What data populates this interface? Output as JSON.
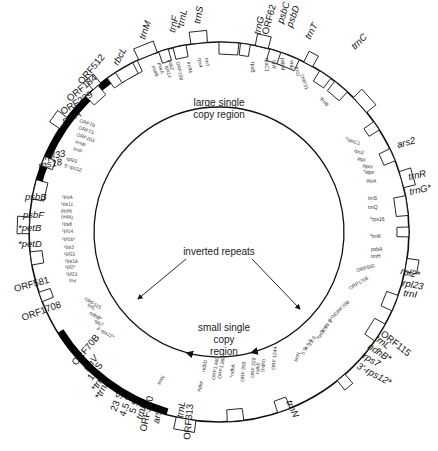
{
  "diagram": {
    "center": [
      219,
      232
    ],
    "outer_radius": 190,
    "inner_arc_radius": 125,
    "colors": {
      "line": "#111111",
      "ir_fill": "#000000",
      "box_fill": "#ffffff"
    },
    "regions": {
      "lsc_line1": "large single",
      "lsc_line2": "copy region",
      "ir": "inverted repeats",
      "ssc_line1": "small single",
      "ssc_line2": "copy",
      "ssc_line3": "region"
    },
    "inverted_repeats": [
      {
        "name": "IR-A",
        "start_deg": 196,
        "end_deg": 238
      },
      {
        "name": "IR-B",
        "start_deg": 283,
        "end_deg": 325
      }
    ],
    "outer_labels": [
      {
        "text": "trnS",
        "x": 200,
        "y": 24,
        "rot": -80,
        "italic": true
      },
      {
        "text": "*trnL",
        "x": 183,
        "y": 30,
        "rot": -78,
        "italic": true
      },
      {
        "text": "trnF",
        "x": 175,
        "y": 33,
        "rot": -78,
        "italic": true
      },
      {
        "text": "trnM",
        "x": 145,
        "y": 40,
        "rot": -72,
        "italic": true
      },
      {
        "text": "rbcL",
        "x": 118,
        "y": 66,
        "rot": -62,
        "italic": true
      },
      {
        "text": "ORF512",
        "x": 82,
        "y": 85,
        "rot": -50,
        "italic": false
      },
      {
        "text": "ORF184",
        "x": 70,
        "y": 102,
        "rot": -40,
        "italic": false
      },
      {
        "text": "ORF229",
        "x": 63,
        "y": 115,
        "rot": -32,
        "italic": false
      },
      {
        "text": "petA",
        "x": 64,
        "y": 124,
        "rot": -25,
        "italic": true
      },
      {
        "text": "rpl33",
        "x": 45,
        "y": 160,
        "rot": -10,
        "italic": true
      },
      {
        "text": "rps18",
        "x": 39,
        "y": 169,
        "rot": -10,
        "italic": true
      },
      {
        "text": "psbB",
        "x": 25,
        "y": 200,
        "rot": 0,
        "italic": true
      },
      {
        "text": "psbF",
        "x": 23,
        "y": 218,
        "rot": 0,
        "italic": true
      },
      {
        "text": "*petB",
        "x": 18,
        "y": 231,
        "rot": 0,
        "italic": true
      },
      {
        "text": "*petD",
        "x": 18,
        "y": 247,
        "rot": 0,
        "italic": true
      },
      {
        "text": "ORF581",
        "x": 15,
        "y": 292,
        "rot": -15,
        "italic": false
      },
      {
        "text": "ORF1708",
        "x": 23,
        "y": 321,
        "rot": -20,
        "italic": false
      },
      {
        "text": "ORF70B",
        "x": 76,
        "y": 366,
        "rot": -50,
        "italic": false
      },
      {
        "text": "trnV",
        "x": 88,
        "y": 372,
        "rot": -52,
        "italic": true
      },
      {
        "text": "16 S",
        "x": 92,
        "y": 381,
        "rot": -55,
        "italic": false
      },
      {
        "text": "*trnI",
        "x": 96,
        "y": 392,
        "rot": -58,
        "italic": true
      },
      {
        "text": "*trnA",
        "x": 100,
        "y": 400,
        "rot": -62,
        "italic": true
      },
      {
        "text": "23 S",
        "x": 116,
        "y": 412,
        "rot": -68,
        "italic": false
      },
      {
        "text": "4.5 S",
        "x": 125,
        "y": 417,
        "rot": -70,
        "italic": false
      },
      {
        "text": "5 S",
        "x": 135,
        "y": 414,
        "rot": -72,
        "italic": false
      },
      {
        "text": "trnR",
        "x": 142,
        "y": 420,
        "rot": -74,
        "italic": true
      },
      {
        "text": "ORF350",
        "x": 146,
        "y": 432,
        "rot": -78,
        "italic": false
      },
      {
        "text": "ars1",
        "x": 159,
        "y": 424,
        "rot": -80,
        "italic": true
      },
      {
        "text": "trnL",
        "x": 183,
        "y": 418,
        "rot": -82,
        "italic": true
      },
      {
        "text": "ORF313",
        "x": 190,
        "y": 440,
        "rot": -85,
        "italic": false
      },
      {
        "text": "trnN",
        "x": 286,
        "y": 402,
        "rot": 65,
        "italic": true
      },
      {
        "text": "ORF115",
        "x": 380,
        "y": 335,
        "rot": 38,
        "italic": false
      },
      {
        "text": "trnL",
        "x": 374,
        "y": 340,
        "rot": 35,
        "italic": true
      },
      {
        "text": "ndhB*",
        "x": 367,
        "y": 348,
        "rot": 33,
        "italic": true
      },
      {
        "text": "rps7",
        "x": 362,
        "y": 358,
        "rot": 30,
        "italic": true
      },
      {
        "text": "3'-rps12*",
        "x": 356,
        "y": 368,
        "rot": 28,
        "italic": true
      },
      {
        "text": "rpl2*",
        "x": 400,
        "y": 274,
        "rot": 12,
        "italic": true
      },
      {
        "text": "rpl23",
        "x": 402,
        "y": 286,
        "rot": 10,
        "italic": true
      },
      {
        "text": "trnI",
        "x": 403,
        "y": 296,
        "rot": 8,
        "italic": true
      },
      {
        "text": "trnR",
        "x": 409,
        "y": 180,
        "rot": -12,
        "italic": true
      },
      {
        "text": "trnG*",
        "x": 410,
        "y": 195,
        "rot": -12,
        "italic": true
      },
      {
        "text": "ars2",
        "x": 398,
        "y": 148,
        "rot": -15,
        "italic": true
      },
      {
        "text": "trnC",
        "x": 355,
        "y": 50,
        "rot": -45,
        "italic": true
      },
      {
        "text": "trnT",
        "x": 310,
        "y": 40,
        "rot": -62,
        "italic": true
      },
      {
        "text": "psbD",
        "x": 292,
        "y": 28,
        "rot": -70,
        "italic": true
      },
      {
        "text": "psbC",
        "x": 283,
        "y": 24,
        "rot": -72,
        "italic": true
      },
      {
        "text": "ORF62",
        "x": 268,
        "y": 35,
        "rot": -75,
        "italic": false
      },
      {
        "text": "trnG",
        "x": 260,
        "y": 35,
        "rot": -77,
        "italic": true
      }
    ],
    "inner_labels": [
      {
        "text": "rpoB",
        "x": 251,
        "y": 62,
        "rot": 90
      },
      {
        "text": "rpoC1",
        "x": 265,
        "y": 58,
        "rot": 90
      },
      {
        "text": "trnY",
        "x": 272,
        "y": 60,
        "rot": 90
      },
      {
        "text": "trnE",
        "x": 290,
        "y": 60,
        "rot": 90
      },
      {
        "text": "trnD",
        "x": 295,
        "y": 67,
        "rot": 80
      },
      {
        "text": "psbM",
        "x": 281,
        "y": 58,
        "rot": 90
      },
      {
        "text": "ORF31",
        "x": 300,
        "y": 75,
        "rot": 70
      },
      {
        "text": "rpoB",
        "x": 320,
        "y": 98,
        "rot": 55
      },
      {
        "text": "*rpoC1",
        "x": 345,
        "y": 140,
        "rot": 20
      },
      {
        "text": "rps2",
        "x": 354,
        "y": 152,
        "rot": 15
      },
      {
        "text": "atpI",
        "x": 357,
        "y": 160,
        "rot": 12
      },
      {
        "text": "atpH",
        "x": 362,
        "y": 167,
        "rot": 10
      },
      {
        "text": "*atpF",
        "x": 363,
        "y": 173,
        "rot": 8
      },
      {
        "text": "atpA",
        "x": 366,
        "y": 182,
        "rot": 5
      },
      {
        "text": "trnS",
        "x": 368,
        "y": 200,
        "rot": 0
      },
      {
        "text": "trnQ",
        "x": 368,
        "y": 209,
        "rot": 0
      },
      {
        "text": "*rps16",
        "x": 370,
        "y": 221,
        "rot": 0
      },
      {
        "text": "*trnK",
        "x": 370,
        "y": 238,
        "rot": 0
      },
      {
        "text": "psbA",
        "x": 371,
        "y": 251,
        "rot": 0
      },
      {
        "text": "trnH",
        "x": 371,
        "y": 258,
        "rot": 0
      },
      {
        "text": "ORF581",
        "x": 357,
        "y": 272,
        "rot": -15
      },
      {
        "text": "ORF1708",
        "x": 350,
        "y": 290,
        "rot": -30
      },
      {
        "text": "ORF79",
        "x": 79,
        "y": 122,
        "rot": 20
      },
      {
        "text": "ORF73",
        "x": 78,
        "y": 129,
        "rot": 20
      },
      {
        "text": "ORF103",
        "x": 76,
        "y": 136,
        "rot": 20
      },
      {
        "text": "trnW",
        "x": 75,
        "y": 143,
        "rot": 20
      },
      {
        "text": "trnP",
        "x": 73,
        "y": 150,
        "rot": 20
      },
      {
        "text": "rpl20",
        "x": 66,
        "y": 160,
        "rot": 15
      },
      {
        "text": "5'-rps12",
        "x": 64,
        "y": 167,
        "rot": 15
      },
      {
        "text": "rpoA",
        "x": 62,
        "y": 198,
        "rot": 5
      },
      {
        "text": "rps11",
        "x": 61,
        "y": 205,
        "rot": 5
      },
      {
        "text": "petN",
        "x": 61,
        "y": 212,
        "rot": 5
      },
      {
        "text": "(infA)",
        "x": 61,
        "y": 218,
        "rot": 5
      },
      {
        "text": "rps8",
        "x": 62,
        "y": 225,
        "rot": 5
      },
      {
        "text": "rpl14",
        "x": 62,
        "y": 232,
        "rot": 5
      },
      {
        "text": "rpl16*",
        "x": 62,
        "y": 240,
        "rot": 5
      },
      {
        "text": "rps3",
        "x": 64,
        "y": 248,
        "rot": 5
      },
      {
        "text": "rpl22",
        "x": 64,
        "y": 255,
        "rot": 5
      },
      {
        "text": "rps19",
        "x": 65,
        "y": 262,
        "rot": 5
      },
      {
        "text": "rpl2*",
        "x": 65,
        "y": 268,
        "rot": 5
      },
      {
        "text": "rpl23",
        "x": 66,
        "y": 275,
        "rot": 5
      },
      {
        "text": "trnI",
        "x": 69,
        "y": 282,
        "rot": 5
      },
      {
        "text": "ORF115",
        "x": 84,
        "y": 300,
        "rot": 30
      },
      {
        "text": "trnL",
        "x": 87,
        "y": 306,
        "rot": 30
      },
      {
        "text": "ndhB*",
        "x": 89,
        "y": 314,
        "rot": 30
      },
      {
        "text": "rps7",
        "x": 94,
        "y": 322,
        "rot": 30
      },
      {
        "text": "3'-rps12*",
        "x": 96,
        "y": 329,
        "rot": 30
      },
      {
        "text": "trnN",
        "x": 160,
        "y": 385,
        "rot": -60
      },
      {
        "text": "ndhF",
        "x": 200,
        "y": 392,
        "rot": -70
      },
      {
        "text": "ndhD",
        "x": 205,
        "y": 372,
        "rot": -80
      },
      {
        "text": "ORF1,460",
        "x": 215,
        "y": 380,
        "rot": -80
      },
      {
        "text": "ORF1,360",
        "x": 221,
        "y": 379,
        "rot": -80
      },
      {
        "text": "*ndhA",
        "x": 233,
        "y": 378,
        "rot": -82
      },
      {
        "text": "ORF 393",
        "x": 244,
        "y": 382,
        "rot": -85
      },
      {
        "text": "ORF 229",
        "x": 254,
        "y": 378,
        "rot": -85
      },
      {
        "text": "ndhE",
        "x": 259,
        "y": 374,
        "rot": -85
      },
      {
        "text": "(ndhI)",
        "x": 264,
        "y": 372,
        "rot": -85
      },
      {
        "text": "ORF 1244",
        "x": 275,
        "y": 370,
        "rot": -85
      },
      {
        "text": "trnN",
        "x": 297,
        "y": 362,
        "rot": -70
      },
      {
        "text": "5 S",
        "x": 304,
        "y": 355,
        "rot": -65
      },
      {
        "text": "4.5 S",
        "x": 307,
        "y": 350,
        "rot": -62
      },
      {
        "text": "23 S",
        "x": 311,
        "y": 346,
        "rot": -60
      },
      {
        "text": "*trnA",
        "x": 319,
        "y": 340,
        "rot": -55
      },
      {
        "text": "*trnI",
        "x": 322,
        "y": 334,
        "rot": -52
      },
      {
        "text": "16 S",
        "x": 326,
        "y": 329,
        "rot": -50
      },
      {
        "text": "trnV",
        "x": 330,
        "y": 322,
        "rot": -48
      },
      {
        "text": "ORF70B",
        "x": 336,
        "y": 316,
        "rot": -45
      },
      {
        "text": "psaA",
        "x": 158,
        "y": 63,
        "rot": 75
      },
      {
        "text": "psaB",
        "x": 152,
        "y": 66,
        "rot": 72
      },
      {
        "text": "rps14",
        "x": 165,
        "y": 66,
        "rot": 75
      },
      {
        "text": "ORF158",
        "x": 176,
        "y": 62,
        "rot": 78
      },
      {
        "text": "psbZ",
        "x": 168,
        "y": 60,
        "rot": 76
      },
      {
        "text": "trnfM",
        "x": 187,
        "y": 62,
        "rot": 80
      },
      {
        "text": "rps4",
        "x": 198,
        "y": 58,
        "rot": 82
      },
      {
        "text": "trnT",
        "x": 205,
        "y": 58,
        "rot": 84
      }
    ]
  }
}
